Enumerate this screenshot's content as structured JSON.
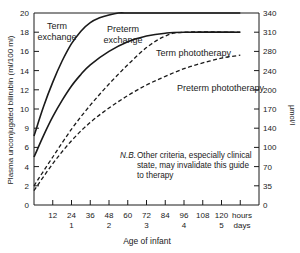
{
  "chart_data": {
    "type": "line",
    "title": "",
    "xlabel": "Age of infant",
    "ylabel": "Plasma unconjugated bilirubin (ml/100 ml)",
    "ylabel_right": "µmol/l",
    "xlim": [
      0,
      132
    ],
    "ylim": [
      0,
      20
    ],
    "ylim_right": [
      0,
      340
    ],
    "grid": false,
    "legend_position": "inline labels",
    "x_ticks_hours": [
      "12",
      "24",
      "36",
      "48",
      "60",
      "72",
      "84",
      "96",
      "108",
      "120"
    ],
    "x_ticks_hours_values": [
      12,
      24,
      36,
      48,
      60,
      72,
      84,
      96,
      108,
      120
    ],
    "x_unit_hours": "hours",
    "x_ticks_days": [
      "1",
      "2",
      "3",
      "4",
      "5"
    ],
    "x_ticks_days_values": [
      24,
      48,
      72,
      96,
      120
    ],
    "x_unit_days": "days",
    "y_ticks_left": [
      "0",
      "2",
      "4",
      "6",
      "9",
      "10",
      "12",
      "14",
      "16",
      "18",
      "20"
    ],
    "y_ticks_left_values": [
      0,
      2,
      4,
      6,
      8,
      10,
      12,
      14,
      16,
      18,
      20
    ],
    "y_ticks_right": [
      "0",
      "35",
      "70",
      "100",
      "140",
      "170",
      "200",
      "240",
      "280",
      "310",
      "340"
    ],
    "y_ticks_right_values": [
      0,
      2,
      4,
      6,
      8,
      10,
      12,
      14,
      16,
      18,
      20
    ],
    "series": [
      {
        "name": "Term exchange",
        "style": "solid",
        "x": [
          0,
          6,
          12,
          18,
          24,
          30,
          36,
          42,
          48,
          54,
          60,
          66,
          72,
          132
        ],
        "y": [
          7.2,
          10.2,
          12.8,
          15.0,
          16.8,
          18.1,
          19.0,
          19.5,
          19.8,
          20,
          20,
          20,
          20,
          20
        ]
      },
      {
        "name": "Preterm exchange",
        "style": "solid",
        "x": [
          0,
          6,
          12,
          18,
          24,
          30,
          36,
          48,
          60,
          72,
          84,
          96,
          132
        ],
        "y": [
          5.0,
          7.2,
          9.2,
          10.9,
          12.4,
          13.6,
          14.6,
          16.0,
          17.0,
          17.6,
          17.9,
          18,
          18
        ]
      },
      {
        "name": "Term phototherapy",
        "style": "dashed",
        "x": [
          0,
          12,
          24,
          36,
          48,
          60,
          72,
          84,
          96,
          132
        ],
        "y": [
          2.0,
          5.0,
          7.9,
          10.4,
          12.6,
          14.6,
          16.4,
          17.6,
          18,
          18
        ]
      },
      {
        "name": "Preterm phototherapy",
        "style": "dashed",
        "x": [
          0,
          12,
          24,
          36,
          48,
          60,
          72,
          84,
          96,
          108,
          120,
          132
        ],
        "y": [
          1.5,
          4.3,
          6.7,
          8.6,
          10.1,
          11.4,
          12.5,
          13.4,
          14.2,
          14.8,
          15.3,
          15.6
        ]
      }
    ],
    "annotations": [
      {
        "text": "Term",
        "x": 28,
        "y": 19.1
      },
      {
        "text": "exchange",
        "x": 28,
        "y": 18.0
      },
      {
        "text": "Preterm",
        "x": 60,
        "y": 18.0
      },
      {
        "text": "exchange",
        "x": 60,
        "y": 16.9
      },
      {
        "text": "Term phototherapy",
        "x": 108,
        "y": 16.5
      },
      {
        "text": "Preterm phototherapy",
        "x": 108,
        "y": 13.4
      },
      {
        "text": "N.B. Other criteria, especially clinical state, may invalidate this guide to therapy",
        "x": 72,
        "y": 7
      }
    ]
  },
  "labels": {
    "term_exchange_line1": "Term",
    "term_exchange_line2": "exchange",
    "preterm_exchange_line1": "Preterm",
    "preterm_exchange_line2": "exchange",
    "term_photo": "Term phototherapy",
    "preterm_photo": "Preterm phototherapy",
    "nb_prefix": "N.B.",
    "nb_line1": "Other criteria, especially clinical",
    "nb_line2": "state, may invalidate this guide",
    "nb_line3": "to therapy",
    "xlabel": "Age of infant",
    "ylabel": "Plasma unconjugated bilirubin (ml/100 ml)",
    "ylabel_right": "µmol/l",
    "hours": "hours",
    "days": "days"
  }
}
